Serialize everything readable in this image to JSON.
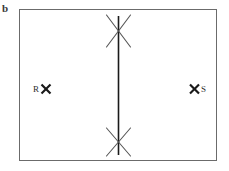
{
  "figure": {
    "panel_label": "b",
    "type": "line-diagram",
    "background_color": "#ffffff",
    "frame": {
      "name": "rectangular-border",
      "stroke_color": "#6b6b6b",
      "stroke_width": 1,
      "x": 19,
      "y": 9,
      "width": 198,
      "height": 152
    }
  },
  "elements": {
    "vertical_line": {
      "label": "",
      "stroke_color": "#1a1a1a",
      "stroke_width": 1.6,
      "x": 118.5,
      "y_top": 16,
      "y_bottom": 155
    },
    "top_cross": {
      "label": "",
      "stroke_color": "#555555",
      "stroke_width": 1.1,
      "center_x": 118.5,
      "center_y": 31,
      "arm_half_width": 12,
      "arm_half_height": 16
    },
    "bottom_cross": {
      "label": "",
      "stroke_color": "#555555",
      "stroke_width": 1.1,
      "center_x": 118.5,
      "center_y": 142,
      "arm_half_width": 12,
      "arm_half_height": 14
    },
    "left_marker": {
      "label": "R",
      "glyph": "x-marker",
      "stroke_color": "#1a1a1a",
      "stroke_width": 2.2,
      "center_x": 46,
      "center_y": 89,
      "size": 9
    },
    "right_marker": {
      "label": "S",
      "glyph": "x-marker",
      "stroke_color": "#1a1a1a",
      "stroke_width": 2.2,
      "center_x": 194.5,
      "center_y": 89,
      "size": 9
    }
  }
}
